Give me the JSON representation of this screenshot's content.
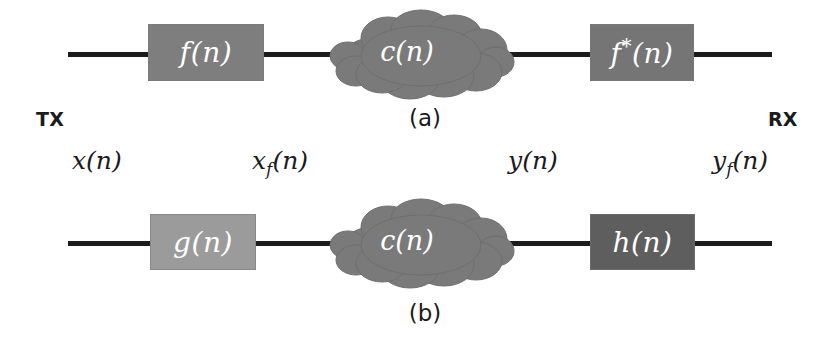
{
  "figure": {
    "width": 825,
    "height": 346,
    "background": "#ffffff",
    "wire_color": "#1c1c1c"
  },
  "endpoints": {
    "transmitter": "TX",
    "receiver": "RX"
  },
  "signals": [
    {
      "name": "x-of-n",
      "label": "x(n)",
      "base": "x",
      "sub": "",
      "tail": "(n)"
    },
    {
      "name": "xf-of-n",
      "label": "x_f(n)",
      "base": "x",
      "sub": "f",
      "tail": "(n)"
    },
    {
      "name": "y-of-n",
      "label": "y(n)",
      "base": "y",
      "sub": "",
      "tail": "(n)"
    },
    {
      "name": "yf-of-n",
      "label": "y_f(n)",
      "base": "y",
      "sub": "f",
      "tail": "(n)"
    }
  ],
  "panels": [
    {
      "caption": "(a)",
      "blocks": [
        {
          "id": "f-block",
          "label": "f(n)",
          "base": "f",
          "sup": "",
          "tail": "(n)",
          "fill": "#7e7e7e",
          "text_color": "#ffffff"
        },
        {
          "id": "channel-cloud-a",
          "label": "c(n)",
          "base": "c",
          "sup": "",
          "tail": "(n)",
          "fill": "#7a7a7a",
          "text_color": "#ffffff"
        },
        {
          "id": "f-conj-block",
          "label": "f*(n)",
          "base": "f",
          "sup": "*",
          "tail": "(n)",
          "fill": "#757575",
          "text_color": "#ffffff"
        }
      ]
    },
    {
      "caption": "(b)",
      "blocks": [
        {
          "id": "g-block",
          "label": "g(n)",
          "base": "g",
          "sup": "",
          "tail": "(n)",
          "fill": "#9b9b9b",
          "text_color": "#ffffff"
        },
        {
          "id": "channel-cloud-b",
          "label": "c(n)",
          "base": "c",
          "sup": "",
          "tail": "(n)",
          "fill": "#7a7a7a",
          "text_color": "#ffffff"
        },
        {
          "id": "h-block",
          "label": "h(n)",
          "base": "h",
          "sup": "",
          "tail": "(n)",
          "fill": "#5e5e5e",
          "text_color": "#ffffff"
        }
      ]
    }
  ]
}
